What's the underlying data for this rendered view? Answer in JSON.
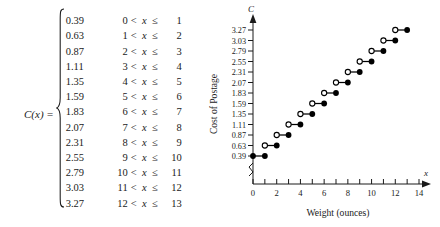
{
  "function_label": "C(x) =",
  "variable": "x",
  "relation_symbol_lt": "<",
  "relation_symbol_le": "≤",
  "cases": [
    {
      "value": "0.39",
      "lo": "0",
      "hi": "1"
    },
    {
      "value": "0.63",
      "lo": "1",
      "hi": "2"
    },
    {
      "value": "0.87",
      "lo": "2",
      "hi": "3"
    },
    {
      "value": "1.11",
      "lo": "3",
      "hi": "4"
    },
    {
      "value": "1.35",
      "lo": "4",
      "hi": "5"
    },
    {
      "value": "1.59",
      "lo": "5",
      "hi": "6"
    },
    {
      "value": "1.83",
      "lo": "6",
      "hi": "7"
    },
    {
      "value": "2.07",
      "lo": "7",
      "hi": "8"
    },
    {
      "value": "2.31",
      "lo": "8",
      "hi": "9"
    },
    {
      "value": "2.55",
      "lo": "9",
      "hi": "10"
    },
    {
      "value": "2.79",
      "lo": "10",
      "hi": "11"
    },
    {
      "value": "3.03",
      "lo": "11",
      "hi": "12"
    },
    {
      "value": "3.27",
      "lo": "12",
      "hi": "13"
    }
  ],
  "chart_data": {
    "type": "line",
    "subtype": "step-function",
    "title": "",
    "xlabel": "Weight (ounces)",
    "ylabel": "Cost of Postage",
    "x_axis_name": "x",
    "y_axis_name": "C",
    "xlim": [
      0,
      14
    ],
    "ylim": [
      0.39,
      3.27
    ],
    "y_axis_broken": true,
    "grid": false,
    "legend": false,
    "x_ticks": [
      0,
      1,
      2,
      3,
      4,
      5,
      6,
      7,
      8,
      9,
      10,
      11,
      12,
      13,
      14
    ],
    "x_tick_labels": [
      "0",
      "",
      "2",
      "",
      "4",
      "",
      "6",
      "",
      "8",
      "",
      "10",
      "",
      "12",
      "",
      "14"
    ],
    "y_ticks": [
      0.39,
      0.63,
      0.87,
      1.11,
      1.35,
      1.59,
      1.83,
      2.07,
      2.31,
      2.55,
      2.79,
      3.03,
      3.27
    ],
    "y_tick_labels": [
      "0.39",
      "0.63",
      "0.87",
      "1.11",
      "1.35",
      "1.59",
      "1.83",
      "2.07",
      "2.31",
      "2.55",
      "2.79",
      "3.03",
      "3.27"
    ],
    "segments": [
      {
        "y": 0.39,
        "x_start": 0,
        "x_end": 1,
        "left_endpoint": "closed",
        "right_endpoint": "closed"
      },
      {
        "y": 0.63,
        "x_start": 1,
        "x_end": 2,
        "left_endpoint": "open",
        "right_endpoint": "closed"
      },
      {
        "y": 0.87,
        "x_start": 2,
        "x_end": 3,
        "left_endpoint": "open",
        "right_endpoint": "closed"
      },
      {
        "y": 1.11,
        "x_start": 3,
        "x_end": 4,
        "left_endpoint": "open",
        "right_endpoint": "closed"
      },
      {
        "y": 1.35,
        "x_start": 4,
        "x_end": 5,
        "left_endpoint": "open",
        "right_endpoint": "closed"
      },
      {
        "y": 1.59,
        "x_start": 5,
        "x_end": 6,
        "left_endpoint": "open",
        "right_endpoint": "closed"
      },
      {
        "y": 1.83,
        "x_start": 6,
        "x_end": 7,
        "left_endpoint": "open",
        "right_endpoint": "closed"
      },
      {
        "y": 2.07,
        "x_start": 7,
        "x_end": 8,
        "left_endpoint": "open",
        "right_endpoint": "closed"
      },
      {
        "y": 2.31,
        "x_start": 8,
        "x_end": 9,
        "left_endpoint": "open",
        "right_endpoint": "closed"
      },
      {
        "y": 2.55,
        "x_start": 9,
        "x_end": 10,
        "left_endpoint": "open",
        "right_endpoint": "closed"
      },
      {
        "y": 2.79,
        "x_start": 10,
        "x_end": 11,
        "left_endpoint": "open",
        "right_endpoint": "closed"
      },
      {
        "y": 3.03,
        "x_start": 11,
        "x_end": 12,
        "left_endpoint": "open",
        "right_endpoint": "closed"
      },
      {
        "y": 3.27,
        "x_start": 12,
        "x_end": 13,
        "left_endpoint": "open",
        "right_endpoint": "closed"
      }
    ]
  },
  "colors": {
    "ink": "#1a1a1a",
    "marker_fill": "#000000",
    "marker_open_fill": "#ffffff",
    "background": "#ffffff"
  }
}
